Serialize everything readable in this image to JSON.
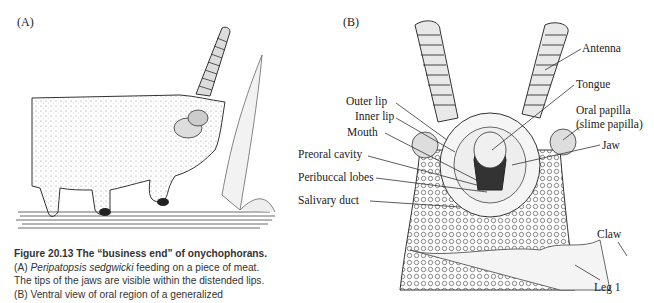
{
  "figure": {
    "panels": {
      "a_label": "(A)",
      "b_label": "(B)"
    },
    "labels_left": [
      "Outer lip",
      "Inner lip",
      "Mouth",
      "Preoral cavity",
      "Peribuccal lobes",
      "Salivary duct"
    ],
    "labels_right": {
      "antenna": "Antenna",
      "tongue": "Tongue",
      "oral_papilla_1": "Oral papilla",
      "oral_papilla_2": "(slime papilla)",
      "jaw": "Jaw",
      "claw": "Claw",
      "leg": "Leg 1"
    },
    "caption": {
      "title": "Figure 20.13   The “business end” of onychophorans.",
      "line_a_species": "Peripatopsis sedgwicki",
      "line_a_rest": " feeding on a piece of meat.",
      "line_a_prefix": "(A) ",
      "line_2": "The tips of the jaws are visible within the distended lips.",
      "line_3": "(B) Ventral view of oral region of a generalized"
    }
  }
}
